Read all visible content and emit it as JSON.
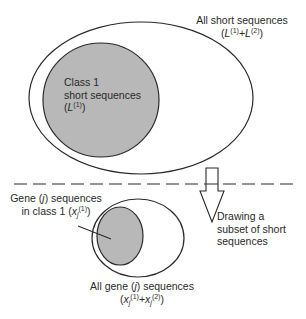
{
  "diagram": {
    "colors": {
      "stroke": "#2a2a2a",
      "fill_gray": "#b8b8b8",
      "background": "#ffffff"
    },
    "top_set": {
      "outer_label_line1": "All short sequences",
      "outer_label_formula": {
        "open": "(",
        "L1_var": "L",
        "L1_sup": "(1)",
        "plus": "+",
        "L2_var": "L",
        "L2_sup": "(2)",
        "close": ")"
      },
      "inner_label_line1": "Class 1",
      "inner_label_line2": "short sequences",
      "inner_label_formula": {
        "open": "(",
        "var": "L",
        "sup": "(1)",
        "close": ")"
      }
    },
    "divider": {
      "style": "dashed"
    },
    "arrow": {
      "direction": "down",
      "label_line1": "Drawing a",
      "label_line2": "subset of short",
      "label_line3": "sequences"
    },
    "bottom_set": {
      "inner_label_line1_pre": "Gene (",
      "inner_label_line1_var": "j",
      "inner_label_line1_post": ") sequences",
      "inner_label_line2_pre": "in class 1 (",
      "inner_label_line2_var": "x",
      "inner_label_line2_sub": "j",
      "inner_label_line2_sup": "(1)",
      "inner_label_line2_post": ")",
      "outer_label_line1_pre": "All gene (",
      "outer_label_line1_var": "j",
      "outer_label_line1_post": ") sequences",
      "outer_label_formula": {
        "open": "(",
        "x1_var": "x",
        "x1_sub": "j",
        "x1_sup": "(1)",
        "plus": "+",
        "x2_var": "x",
        "x2_sub": "j",
        "x2_sup": "(2)",
        "close": ")"
      }
    }
  }
}
